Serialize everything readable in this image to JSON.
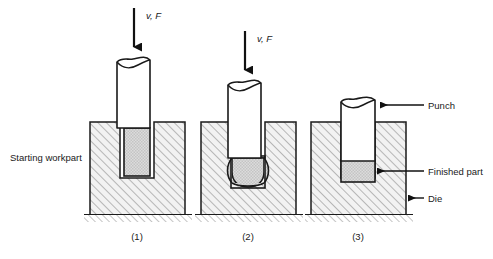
{
  "figure": {
    "background": "#ffffff",
    "line_color": "#1a1a1a",
    "die_fill": "#f2f2f2",
    "die_hatch_color": "#7a7a7a",
    "part_fill": "#d0d0d0",
    "punch_fill": "#ffffff",
    "ground_hatch_color": "#8c8c8c"
  },
  "force_labels": [
    {
      "id": "force-1",
      "text": "v, F"
    },
    {
      "id": "force-2",
      "text": "v, F"
    }
  ],
  "callouts": {
    "starting_workpart": "Starting workpart",
    "punch": "Punch",
    "finished_part": "Finished part",
    "die": "Die"
  },
  "stages": [
    {
      "id": "stage-1",
      "number": "(1)",
      "caption_x": 137
    },
    {
      "id": "stage-2",
      "number": "(2)",
      "caption_x": 248
    },
    {
      "id": "stage-3",
      "number": "(3)",
      "caption_x": 358
    }
  ]
}
